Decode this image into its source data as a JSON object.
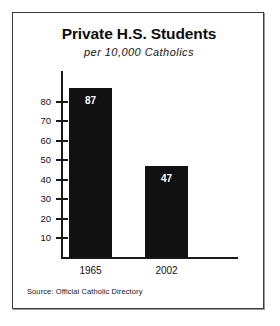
{
  "chart_data": {
    "type": "bar",
    "title": "Private H.S. Students",
    "subtitle": "per 10,000 Catholics",
    "categories": [
      "1965",
      "2002"
    ],
    "values": [
      87,
      47
    ],
    "value_labels": [
      "87",
      "47"
    ],
    "xlabel": "",
    "ylabel": "",
    "ylim": [
      0,
      90
    ],
    "ytick_labels": [
      "80",
      "70",
      "60",
      "50",
      "40",
      "30",
      "20",
      "10"
    ],
    "ytick_values": [
      80,
      70,
      60,
      50,
      40,
      30,
      20,
      10
    ],
    "grid": false,
    "legend": false,
    "source": "Source: Official Catholic Directory",
    "colors": {
      "bar": "#111111",
      "value_label": "#ffffff",
      "axis": "#1a1a1a",
      "text": "#111111",
      "background": "#ffffff",
      "border": "#3b3b3b"
    }
  }
}
